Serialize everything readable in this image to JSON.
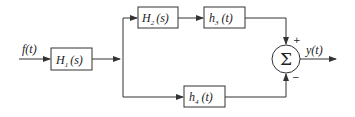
{
  "diagram": {
    "input_label": "f(t)",
    "output_label": "y(t)",
    "blocks": {
      "h1": {
        "main": "H",
        "sub": "1",
        "arg": "(s)"
      },
      "h2": {
        "main": "H",
        "sub": "2",
        "arg": "(s)"
      },
      "h3": {
        "main": "h",
        "sub": "3",
        "arg": "(t)"
      },
      "h4": {
        "main": "h",
        "sub": "4",
        "arg": "(t)"
      }
    },
    "summer": {
      "symbol": "Σ",
      "plus": "+",
      "minus": "−"
    },
    "colors": {
      "line": "#333333",
      "background": "#ffffff"
    }
  }
}
